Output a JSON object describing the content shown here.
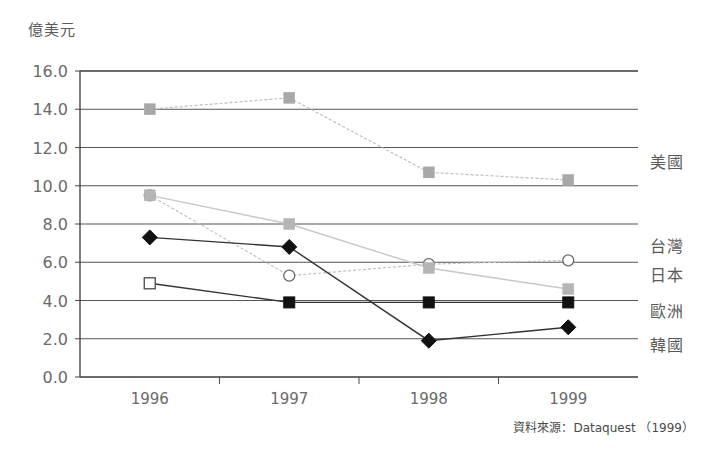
{
  "unit_label": "億美元",
  "source_note": "資料來源：Dataquest （1999）",
  "chart_data": {
    "type": "line",
    "title": "",
    "subtitle": "",
    "xlabel": "",
    "ylabel": "億美元",
    "categories": [
      "1996",
      "1997",
      "1998",
      "1999"
    ],
    "x": [
      1996,
      1997,
      1998,
      1999
    ],
    "ylim": [
      0.0,
      16.0
    ],
    "ytick_labels": [
      "0.0",
      "2.0",
      "4.0",
      "6.0",
      "8.0",
      "10.0",
      "12.0",
      "14.0",
      "16.0"
    ],
    "ytick_values": [
      0.0,
      2.0,
      4.0,
      6.0,
      8.0,
      10.0,
      12.0,
      14.0,
      16.0
    ],
    "grid": true,
    "legend_position": "right",
    "series": [
      {
        "name": "美國",
        "values": [
          14.0,
          14.6,
          10.7,
          10.3
        ],
        "marker": "square-filled",
        "color": "#a8a8a8",
        "line_color": "#bdbdbd",
        "line_style": "dotted"
      },
      {
        "name": "台灣",
        "values": [
          9.5,
          5.3,
          5.9,
          6.1
        ],
        "marker": "circle-open",
        "color": "#ffffff",
        "line_color": "#c0c0c0",
        "line_style": "dotted"
      },
      {
        "name": "日本",
        "values": [
          9.5,
          8.0,
          5.7,
          4.6
        ],
        "marker": "square-filled",
        "color": "#b5b5b5",
        "line_color": "#c8c8c8",
        "line_style": "solid"
      },
      {
        "name": "歐洲",
        "values": [
          4.9,
          3.9,
          3.9,
          3.9
        ],
        "marker": "square-filled-dark",
        "color": "#111111",
        "line_color": "#333333",
        "line_style": "solid"
      },
      {
        "name": "韓國",
        "values": [
          7.3,
          6.8,
          1.9,
          2.6
        ],
        "marker": "diamond-filled",
        "color": "#111111",
        "line_color": "#333333",
        "line_style": "solid"
      }
    ],
    "legend_entries": [
      {
        "label": "美國",
        "y_value": 11.3
      },
      {
        "label": "台灣",
        "y_value": 6.9
      },
      {
        "label": "日本",
        "y_value": 5.4
      },
      {
        "label": "歐洲",
        "y_value": 3.5
      },
      {
        "label": "韓國",
        "y_value": 1.7
      }
    ]
  }
}
